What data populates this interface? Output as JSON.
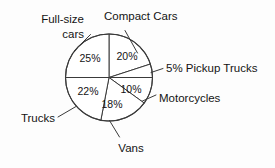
{
  "chart_data": {
    "type": "pie",
    "title": "",
    "subtitle": "",
    "xlabel": "",
    "ylabel": "",
    "units": "percent",
    "legend_position": "none",
    "grid": false,
    "start_angle_deg": 0,
    "direction": "clockwise",
    "categories": [
      "Compact Cars",
      "Pickup Trucks",
      "Motorcycles",
      "Vans",
      "Trucks",
      "Full-size cars"
    ],
    "values": [
      20,
      5,
      10,
      18,
      22,
      25
    ],
    "value_labels": [
      "20%",
      "5%",
      "10%",
      "18%",
      "22%",
      "25%"
    ],
    "total": 100,
    "slices": [
      {
        "name": "Compact Cars",
        "value": 20,
        "value_label": "20%",
        "callout_label": "Compact Cars",
        "value_shown_inside": true,
        "start_deg": 0,
        "end_deg": 72
      },
      {
        "name": "Pickup Trucks",
        "value": 5,
        "value_label": "5%",
        "callout_label": "5% Pickup Trucks",
        "value_shown_inside": false,
        "start_deg": 72,
        "end_deg": 90
      },
      {
        "name": "Motorcycles",
        "value": 10,
        "value_label": "10%",
        "callout_label": "Motorcycles",
        "value_shown_inside": true,
        "start_deg": 90,
        "end_deg": 126
      },
      {
        "name": "Vans",
        "value": 18,
        "value_label": "18%",
        "callout_label": "Vans",
        "value_shown_inside": true,
        "start_deg": 126,
        "end_deg": 190.8
      },
      {
        "name": "Trucks",
        "value": 22,
        "value_label": "22%",
        "callout_label": "Trucks",
        "value_shown_inside": true,
        "start_deg": 190.8,
        "end_deg": 270
      },
      {
        "name": "Full-size cars",
        "value": 25,
        "value_label": "25%",
        "callout_label": "Full-size cars",
        "callout_label_line1": "Full-size",
        "callout_label_line2": "cars",
        "value_shown_inside": true,
        "start_deg": 270,
        "end_deg": 360
      }
    ],
    "colors": {
      "slice_fill": "#ffffff",
      "slice_stroke": "#3a3a3a",
      "text": "#141414",
      "background": "#fdfdfd"
    }
  },
  "callouts": {
    "full_size_cars_line1": "Full-size",
    "full_size_cars_line2": "cars",
    "compact_cars": "Compact Cars",
    "pickup_trucks": "5% Pickup Trucks",
    "motorcycles": "Motorcycles",
    "vans": "Vans",
    "trucks": "Trucks"
  },
  "slice_values": {
    "compact_cars": "20%",
    "motorcycles": "10%",
    "vans": "18%",
    "trucks": "22%",
    "full_size_cars": "25%"
  }
}
